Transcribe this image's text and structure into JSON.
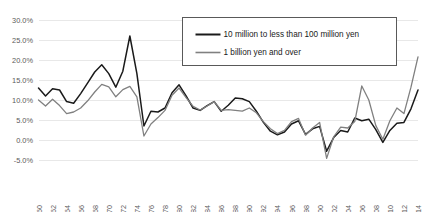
{
  "chart_data": {
    "type": "line",
    "title": "",
    "xlabel": "",
    "ylabel": "",
    "ylim": [
      -5,
      30
    ],
    "yticks": [
      "-5.0%",
      "0.0%",
      "5.0%",
      "10.0%",
      "15.0%",
      "20.0%",
      "25.0%",
      "30.0%"
    ],
    "ytick_values": [
      -5,
      0,
      5,
      10,
      15,
      20,
      25,
      30
    ],
    "grid": true,
    "legend_position": "top-right",
    "xtick_labels": [
      "1960",
      "1962",
      "1964",
      "1966",
      "1968",
      "1970",
      "1972",
      "1974",
      "1976",
      "1978",
      "1980",
      "1982",
      "1984",
      "1986",
      "1988",
      "1990",
      "1992",
      "1994",
      "1996",
      "1998",
      "2000",
      "2002",
      "2004",
      "2006",
      "2008",
      "2010",
      "2012",
      "2014"
    ],
    "x": [
      1960,
      1961,
      1962,
      1963,
      1964,
      1965,
      1966,
      1967,
      1968,
      1969,
      1970,
      1971,
      1972,
      1973,
      1974,
      1975,
      1976,
      1977,
      1978,
      1979,
      1980,
      1981,
      1982,
      1983,
      1984,
      1985,
      1986,
      1987,
      1988,
      1989,
      1990,
      1991,
      1992,
      1993,
      1994,
      1995,
      1996,
      1997,
      1998,
      1999,
      2000,
      2001,
      2002,
      2003,
      2004,
      2005,
      2006,
      2007,
      2008,
      2009,
      2010,
      2011,
      2012,
      2013,
      2014
    ],
    "series": [
      {
        "name": "10 million to less than 100 million yen",
        "color": "#1a1a1a",
        "values": [
          13.0,
          11.0,
          12.8,
          12.5,
          9.6,
          9.2,
          11.6,
          14.3,
          17.0,
          18.8,
          16.6,
          13.2,
          17.2,
          26.0,
          16.6,
          3.5,
          7.2,
          7.0,
          8.0,
          11.8,
          13.8,
          11.0,
          8.0,
          7.4,
          8.6,
          9.6,
          7.2,
          8.7,
          10.5,
          10.3,
          9.6,
          7.2,
          4.4,
          2.2,
          1.3,
          2.0,
          4.0,
          4.8,
          1.4,
          2.8,
          3.4,
          -2.8,
          0.6,
          2.4,
          2.0,
          5.5,
          4.8,
          5.2,
          2.6,
          -0.6,
          2.4,
          4.2,
          4.4,
          7.8,
          12.5
        ]
      },
      {
        "name": "1 billion yen and over",
        "color": "#808080",
        "values": [
          10.0,
          8.5,
          10.2,
          8.6,
          6.6,
          7.0,
          8.0,
          9.8,
          12.0,
          13.9,
          13.3,
          10.8,
          12.6,
          13.4,
          10.8,
          1.0,
          4.0,
          5.6,
          7.4,
          11.2,
          13.0,
          10.6,
          8.4,
          7.5,
          8.5,
          9.6,
          7.4,
          7.6,
          7.4,
          7.2,
          8.0,
          6.8,
          4.6,
          2.8,
          1.6,
          2.4,
          4.6,
          5.4,
          1.2,
          3.0,
          4.4,
          -4.6,
          0.8,
          3.2,
          3.0,
          4.6,
          13.5,
          10.0,
          3.6,
          0.2,
          4.8,
          8.0,
          6.6,
          13.2,
          20.8
        ]
      }
    ]
  },
  "legend": {
    "entries": [
      {
        "label": "10 million to less than 100 million yen",
        "marker": "line-black"
      },
      {
        "label": "1 billion yen and over",
        "marker": "line-gray"
      }
    ]
  }
}
